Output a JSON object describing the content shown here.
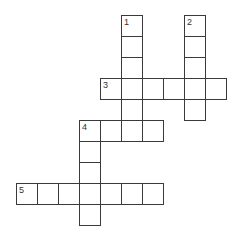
{
  "puzzle": {
    "cell_size": 21,
    "origin_x": 16,
    "origin_y": 15,
    "entries": [
      {
        "number": "1",
        "direction": "down",
        "col": 5,
        "row": 0,
        "length": 6
      },
      {
        "number": "2",
        "direction": "down",
        "col": 8,
        "row": 0,
        "length": 5
      },
      {
        "number": "3",
        "direction": "across",
        "col": 4,
        "row": 3,
        "length": 6
      },
      {
        "number": "4",
        "direction": "across",
        "col": 3,
        "row": 5,
        "length": 4
      },
      {
        "number": "4",
        "direction": "down",
        "col": 3,
        "row": 5,
        "length": 5
      },
      {
        "number": "5",
        "direction": "across",
        "col": 0,
        "row": 8,
        "length": 7
      }
    ]
  }
}
